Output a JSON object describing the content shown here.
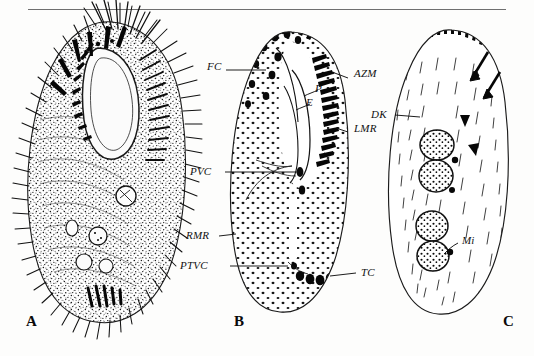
{
  "figure": {
    "running_head": "",
    "background_color": "#fdfdfc",
    "ink_color": "#111111",
    "panels": [
      {
        "id": "A",
        "letter": "A",
        "caption": "A",
        "description": "Photomicrograph-style stipple drawing of live ciliate showing dense somatic cilia, buccal field and cortical granules",
        "labels": []
      },
      {
        "id": "B",
        "letter": "B",
        "caption": "B",
        "description": "Schematic of ventral infraciliature showing cirral pattern and adoral zone of membranelles",
        "labels": [
          {
            "name": "FC",
            "text": "FC"
          },
          {
            "name": "P",
            "text": "P"
          },
          {
            "name": "E",
            "text": "E"
          },
          {
            "name": "AZM",
            "text": "AZM"
          },
          {
            "name": "LMR",
            "text": "LMR"
          },
          {
            "name": "PVC",
            "text": "PVC"
          },
          {
            "name": "RMR",
            "text": "RMR"
          },
          {
            "name": "PTVC",
            "text": "PTVC"
          },
          {
            "name": "TC",
            "text": "TC"
          }
        ]
      },
      {
        "id": "C",
        "letter": "C",
        "caption": "C",
        "description": "Schematic of dorsal side showing dorsal kineties, macronuclear nodules, micronuclei, arrows and arrowheads",
        "labels": [
          {
            "name": "DK",
            "text": "DK"
          },
          {
            "name": "Mi",
            "text": "Mi"
          }
        ],
        "markers": {
          "arrows": 2,
          "arrowheads": 2,
          "macronuclear_nodules": 4
        }
      }
    ],
    "label_positions": {
      "FC": {
        "x": 207,
        "y": 66
      },
      "P": {
        "x": 313,
        "y": 88
      },
      "E": {
        "x": 304,
        "y": 99
      },
      "AZM": {
        "x": 353,
        "y": 74
      },
      "LMR": {
        "x": 353,
        "y": 128
      },
      "PVC": {
        "x": 200,
        "y": 168
      },
      "RMR": {
        "x": 198,
        "y": 232
      },
      "PTVC": {
        "x": 196,
        "y": 262
      },
      "TC": {
        "x": 360,
        "y": 269
      },
      "DK": {
        "x": 378,
        "y": 110
      },
      "Mi": {
        "x": 461,
        "y": 241
      }
    },
    "panel_letter_positions": {
      "A": {
        "x": 26,
        "y": 320
      },
      "B": {
        "x": 234,
        "y": 320
      },
      "C": {
        "x": 503,
        "y": 320
      }
    }
  }
}
